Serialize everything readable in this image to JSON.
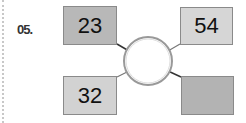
{
  "problem": {
    "number": "05.",
    "boxes": {
      "top_left": {
        "value": "23",
        "color": "#b8b8b8"
      },
      "top_right": {
        "value": "54",
        "color": "#d6d6d6"
      },
      "bottom_left": {
        "value": "32",
        "color": "#d2d2d2"
      },
      "bottom_right": {
        "value": "",
        "color": "#b3b3b3"
      }
    },
    "center_circle": {
      "value": ""
    }
  }
}
